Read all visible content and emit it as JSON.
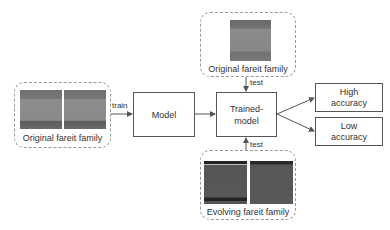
{
  "diagram": {
    "nodes": {
      "train_family": {
        "label": "Original fareit family",
        "type": "image-group",
        "images": 2
      },
      "test_original_family": {
        "label": "Original fareit family",
        "type": "image-group",
        "images": 1
      },
      "test_evolving_family": {
        "label": "Evolving fareit family",
        "type": "image-group",
        "images": 2
      },
      "model": {
        "label": "Model"
      },
      "trained_model": {
        "label_line1": "Trained-",
        "label_line2": "model"
      },
      "high_accuracy": {
        "label_line1": "High",
        "label_line2": "accuracy"
      },
      "low_accuracy": {
        "label_line1": "Low",
        "label_line2": "accuracy"
      }
    },
    "edges": [
      {
        "from": "train_family",
        "to": "model",
        "label": "train"
      },
      {
        "from": "model",
        "to": "trained_model",
        "label": ""
      },
      {
        "from": "test_original_family",
        "to": "trained_model",
        "label": "test"
      },
      {
        "from": "test_evolving_family",
        "to": "trained_model",
        "label": "test"
      },
      {
        "from": "trained_model",
        "to": "high_accuracy",
        "label": ""
      },
      {
        "from": "trained_model",
        "to": "low_accuracy",
        "label": ""
      }
    ],
    "edge_labels": {
      "train": "train",
      "test_top": "test",
      "test_bottom": "test"
    },
    "colors": {
      "line": "#555555",
      "group_border": "#999999"
    }
  }
}
